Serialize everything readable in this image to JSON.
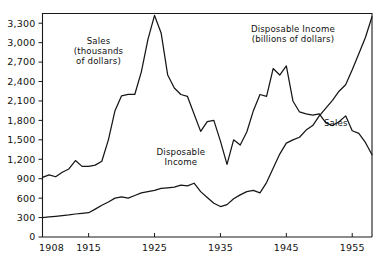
{
  "chart_data": {
    "type": "line",
    "title": "",
    "subtitle": "",
    "xlabel": "",
    "ylabel": "",
    "xlim": [
      1908,
      1958
    ],
    "ylim": [
      0,
      3450
    ],
    "grid": false,
    "legend_position": "inline-annotations",
    "x_tick_labels": [
      "1908",
      "1915",
      "1925",
      "1935",
      "1945",
      "1955"
    ],
    "x_tick_values": [
      1908,
      1915,
      1925,
      1935,
      1945,
      1955
    ],
    "y_tick_labels": [
      "0",
      "300",
      "600",
      "900",
      "1,200",
      "1,500",
      "1,800",
      "2,100",
      "2,400",
      "2,700",
      "3,000",
      "3,300"
    ],
    "y_tick_values": [
      0,
      300,
      600,
      900,
      1200,
      1500,
      1800,
      2100,
      2400,
      2700,
      3000,
      3300
    ],
    "annotations": [
      {
        "name": "sales-series-label",
        "lines": [
          "Sales",
          "(thousands",
          "of dollars)"
        ],
        "x": 1916.5,
        "y": 2980
      },
      {
        "name": "disposable-income-series-label",
        "lines": [
          "Disposable Income",
          "(billions of dollars)"
        ],
        "x": 1946.0,
        "y": 3170
      },
      {
        "name": "disposable-income-inline-label",
        "lines": [
          "Disposable",
          "Income"
        ],
        "x": 1929.0,
        "y": 1270
      },
      {
        "name": "sales-inline-label",
        "lines": [
          "Sales"
        ],
        "x": 1952.5,
        "y": 1720
      }
    ],
    "series": [
      {
        "name": "Sales",
        "unit": "thousands of dollars",
        "x": [
          1908,
          1909,
          1910,
          1911,
          1912,
          1913,
          1914,
          1915,
          1916,
          1917,
          1918,
          1919,
          1920,
          1921,
          1922,
          1923,
          1924,
          1925,
          1926,
          1927,
          1928,
          1929,
          1930,
          1931,
          1932,
          1933,
          1934,
          1935,
          1936,
          1937,
          1938,
          1939,
          1940,
          1941,
          1942,
          1943,
          1944,
          1945,
          1946,
          1947,
          1948,
          1949,
          1950,
          1951,
          1952,
          1953,
          1954,
          1955,
          1956,
          1957,
          1958
        ],
        "values": [
          920,
          960,
          930,
          1000,
          1050,
          1180,
          1090,
          1090,
          1110,
          1170,
          1500,
          1950,
          2180,
          2200,
          2200,
          2550,
          3050,
          3420,
          3150,
          2500,
          2300,
          2200,
          2170,
          1900,
          1630,
          1780,
          1800,
          1480,
          1120,
          1500,
          1420,
          1620,
          1950,
          2200,
          2170,
          2600,
          2500,
          2640,
          2100,
          1930,
          1900,
          1880,
          1900,
          1760,
          1720,
          1780,
          1870,
          1640,
          1600,
          1460,
          1270
        ]
      },
      {
        "name": "Disposable Income",
        "unit": "billions of dollars",
        "x": [
          1908,
          1909,
          1910,
          1911,
          1912,
          1913,
          1914,
          1915,
          1916,
          1917,
          1918,
          1919,
          1920,
          1921,
          1922,
          1923,
          1924,
          1925,
          1926,
          1927,
          1928,
          1929,
          1930,
          1931,
          1932,
          1933,
          1934,
          1935,
          1936,
          1937,
          1938,
          1939,
          1940,
          1941,
          1942,
          1943,
          1944,
          1945,
          1946,
          1947,
          1948,
          1949,
          1950,
          1951,
          1952,
          1953,
          1954,
          1955,
          1956,
          1957,
          1958
        ],
        "values": [
          300,
          310,
          320,
          330,
          340,
          355,
          365,
          375,
          430,
          490,
          540,
          600,
          620,
          600,
          640,
          680,
          700,
          720,
          750,
          760,
          770,
          800,
          790,
          830,
          700,
          610,
          520,
          470,
          500,
          590,
          650,
          700,
          720,
          680,
          840,
          1060,
          1280,
          1450,
          1500,
          1540,
          1650,
          1720,
          1870,
          1990,
          2110,
          2250,
          2350,
          2580,
          2830,
          3080,
          3400
        ]
      }
    ]
  }
}
